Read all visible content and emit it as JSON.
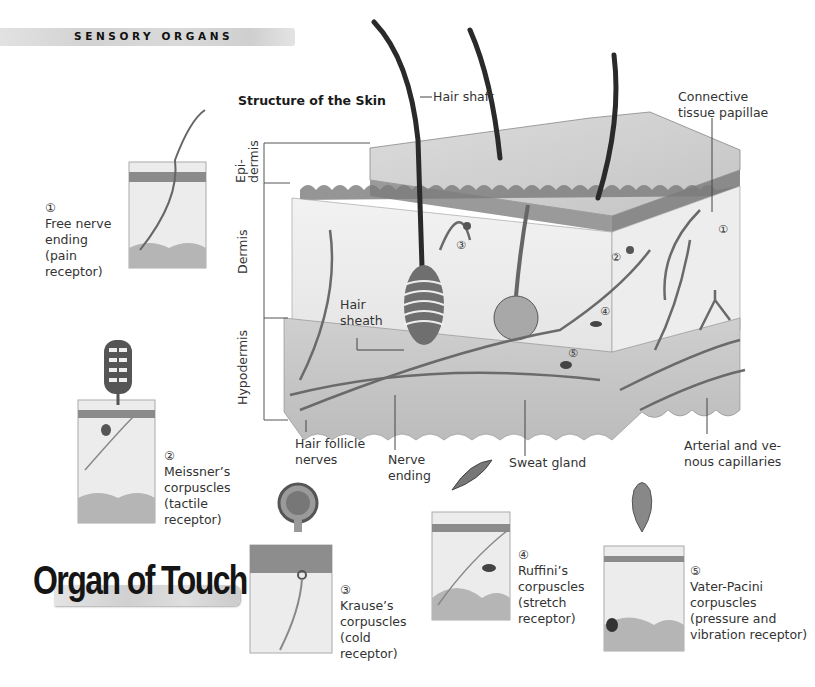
{
  "header": {
    "section_label": "SENSORY ORGANS"
  },
  "diagram": {
    "title": "Structure of the Skin",
    "layer_labels": {
      "epidermis": "Epi-\ndermis",
      "epidermis_line1": "Epi-",
      "epidermis_line2": "dermis",
      "dermis": "Dermis",
      "hypodermis": "Hypodermis"
    },
    "callouts": {
      "hair_shaft": "Hair shaft",
      "connective_tissue_line1": "Connective",
      "connective_tissue_line2": "tissue papillae",
      "hair_sheath_line1": "Hair",
      "hair_sheath_line2": "sheath",
      "hair_follicle_nerves_line1": "Hair follicle",
      "hair_follicle_nerves_line2": "nerves",
      "nerve_ending_line1": "Nerve",
      "nerve_ending_line2": "ending",
      "sweat_gland": "Sweat gland",
      "capillaries_line1": "Arterial and ve-",
      "capillaries_line2": "nous capillaries"
    },
    "markers": [
      "①",
      "②",
      "③",
      "④",
      "⑤"
    ]
  },
  "receptors": [
    {
      "number": "①",
      "name_line1": "Free nerve",
      "name_line2": "ending",
      "type_line1": "(pain",
      "type_line2": "receptor)"
    },
    {
      "number": "②",
      "name_line1": "Meissner’s",
      "name_line2": "corpuscles",
      "type_line1": "(tactile",
      "type_line2": "receptor)"
    },
    {
      "number": "③",
      "name_line1": "Krause’s",
      "name_line2": "corpuscles",
      "type_line1": "(cold",
      "type_line2": "receptor)"
    },
    {
      "number": "④",
      "name_line1": "Ruffini’s",
      "name_line2": "corpuscles",
      "type_line1": "(stretch",
      "type_line2": "receptor)"
    },
    {
      "number": "⑤",
      "name_line1": "Vater-Pacini",
      "name_line2": "corpuscles",
      "type_line1": "(pressure and",
      "type_line2": "vibration receptor)"
    }
  ],
  "footer": {
    "page_title": "Organ of Touch"
  },
  "colors": {
    "ink": "#222222",
    "skin_light": "#e6e6e6",
    "skin_mid": "#bdbdbd",
    "skin_dark": "#6a6a6a",
    "hair": "#2a2a2a"
  }
}
